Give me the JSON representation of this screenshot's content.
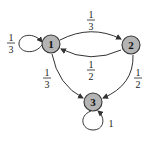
{
  "diagram": {
    "type": "markov-chain-state-diagram",
    "nodes": [
      {
        "id": "1",
        "label": "1"
      },
      {
        "id": "2",
        "label": "2"
      },
      {
        "id": "3",
        "label": "3"
      }
    ],
    "edges": [
      {
        "from": "1",
        "to": "1",
        "num": "1",
        "den": "3"
      },
      {
        "from": "1",
        "to": "2",
        "num": "1",
        "den": "3"
      },
      {
        "from": "2",
        "to": "1",
        "num": "1",
        "den": "2"
      },
      {
        "from": "1",
        "to": "3",
        "num": "1",
        "den": "3"
      },
      {
        "from": "2",
        "to": "3",
        "num": "1",
        "den": "2"
      },
      {
        "from": "3",
        "to": "3",
        "label": "1"
      }
    ]
  }
}
